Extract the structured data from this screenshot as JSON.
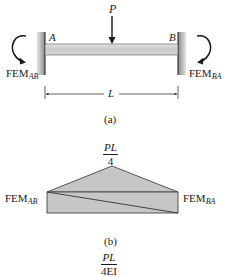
{
  "figure": {
    "part_a": {
      "caption": "(a)",
      "load_label": "P",
      "support_left_label": "A",
      "support_right_label": "B",
      "moment_left": {
        "base": "FEM",
        "sub": "AB"
      },
      "moment_right": {
        "base": "FEM",
        "sub": "BA"
      },
      "span_label": "L"
    },
    "part_b": {
      "caption": "(b)",
      "peak_label": {
        "numerator": "PL",
        "denominator": "4"
      },
      "left_label": {
        "base": "FEM",
        "sub": "AB"
      },
      "right_label": {
        "base": "FEM",
        "sub": "BA"
      }
    },
    "part_c_partial": {
      "peak_label": {
        "numerator": "PL",
        "denominator": "4EI"
      }
    }
  },
  "colors": {
    "ink": "#1a1a1a",
    "beam_fill": "#cfcfcf",
    "wall_fill": "#9a9a9a",
    "diagram_fill": "#c8c8c8"
  }
}
